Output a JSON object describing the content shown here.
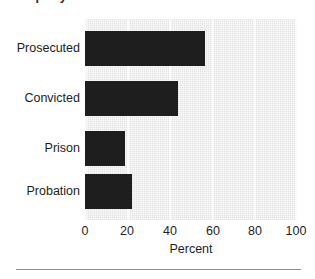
{
  "chart_data": {
    "type": "bar",
    "orientation": "horizontal",
    "title": "Property Offenses — Probation",
    "xlabel": "Percent",
    "ylabel": "",
    "categories": [
      "Prosecuted",
      "Convicted",
      "Prison",
      "Probation"
    ],
    "values": [
      56.5,
      44,
      19,
      22
    ],
    "xlim": [
      0,
      100
    ],
    "xticks": [
      0,
      20,
      40,
      60,
      80,
      100
    ],
    "xtick_labels": [
      "0",
      "20",
      "40",
      "60",
      "80",
      "100"
    ],
    "grid": true,
    "gridline_orientation": "vertical",
    "legend": null,
    "bar_color": "#1e1e1e",
    "plot_background": "#e4e4e4",
    "gridline_color": "#fbfbfb",
    "series": [
      {
        "name": "Percent",
        "values": [
          56.5,
          44,
          19,
          22
        ]
      }
    ]
  }
}
